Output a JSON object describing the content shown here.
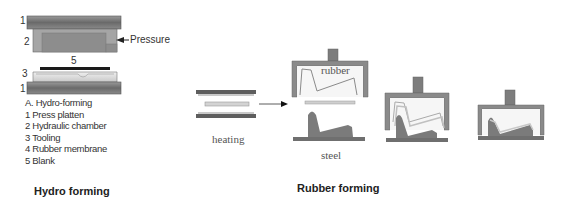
{
  "hydro_forming": {
    "caption": "Hydro forming",
    "pressure_label": "Pressure",
    "part_numbers": {
      "top_platen": "1",
      "chamber": "2",
      "tooling": "3",
      "bottom_platen": "1",
      "blank": "5"
    },
    "legend": [
      "A. Hydro-forming",
      "1 Press platten",
      "2 Hydraulic chamber",
      "3 Tooling",
      "4 Rubber membrane",
      "5 Blank"
    ]
  },
  "rubber_forming": {
    "caption": "Rubber forming",
    "stages": [
      {
        "name": "heating",
        "label": "heating"
      },
      {
        "name": "setup",
        "label_top": "rubber",
        "label_bottom": "steel"
      },
      {
        "name": "pressing",
        "label": ""
      },
      {
        "name": "formed",
        "label": ""
      }
    ]
  },
  "colors": {
    "platen": "#6e6e6e",
    "chamber": "#9a9a9a",
    "tooling": "#d8d8d8",
    "blank": "#1a1a1a",
    "die": "#7f7f7f",
    "rubber_frame": "#7a7a7a",
    "sheet": "#c8c8c8"
  }
}
